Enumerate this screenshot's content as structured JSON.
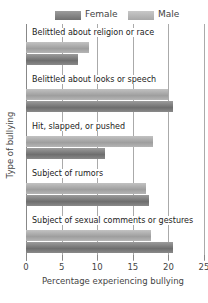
{
  "chart_data": {
    "type": "bar",
    "orientation": "horizontal",
    "title": "",
    "xlabel": "Percentage experiencing bullying",
    "ylabel": "Type of bullying",
    "xlim": [
      0,
      25
    ],
    "xticks": [
      "0",
      "5",
      "10",
      "15",
      "20",
      "25"
    ],
    "grid": true,
    "legend_position": "top",
    "categories": [
      "Belittled about religion or race",
      "Belittled about looks or speech",
      "Hit, slapped, or pushed",
      "Subject of rumors",
      "Subject of sexual comments or gestures"
    ],
    "series": [
      {
        "name": "Male",
        "color": "#b0b0b0",
        "values": [
          8.9,
          19.9,
          17.9,
          16.8,
          17.5
        ]
      },
      {
        "name": "Female",
        "color": "#7a7a7a",
        "values": [
          7.3,
          20.7,
          11.1,
          17.3,
          20.7
        ]
      }
    ]
  },
  "legend": {
    "female": "Female",
    "male": "Male"
  }
}
